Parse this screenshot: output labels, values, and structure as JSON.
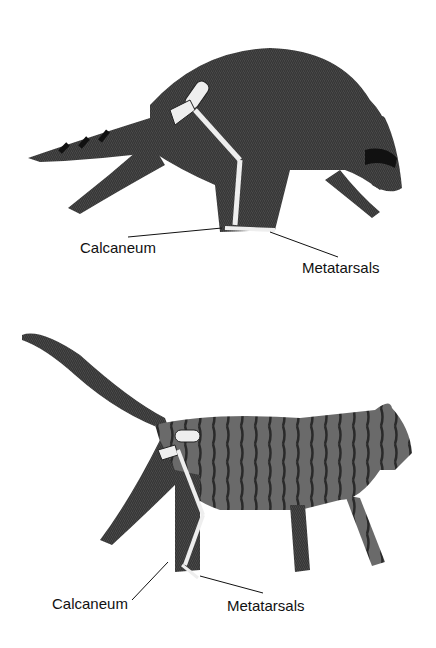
{
  "figures": [
    {
      "animal": "raccoon",
      "labels": {
        "calcaneum": "Calcaneum",
        "metatarsals": "Metatarsals"
      }
    },
    {
      "animal": "cat",
      "labels": {
        "calcaneum": "Calcaneum",
        "metatarsals": "Metatarsals"
      }
    }
  ],
  "colors": {
    "fur": "#3a3a3a",
    "bone": "#e8e8e8",
    "background": "#ffffff",
    "text": "#111111"
  }
}
